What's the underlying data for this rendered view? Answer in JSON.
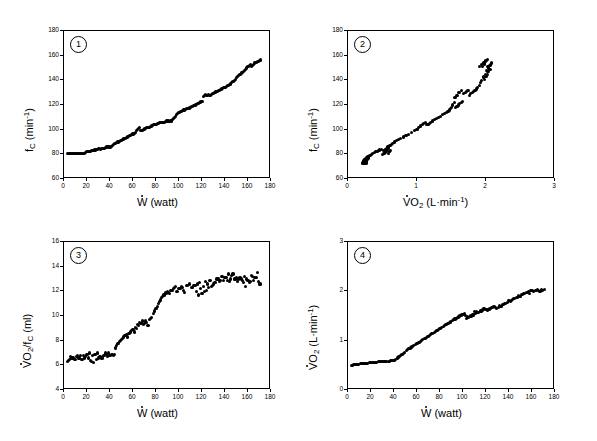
{
  "figure": {
    "background": "#ffffff",
    "marker_color": "#000000",
    "axis_color": "#000000",
    "layout": "2x2 grid of scatter panels"
  },
  "chart_data": [
    {
      "type": "scatter",
      "panel_number": "1",
      "title": "",
      "xlabel": "W (watt)",
      "xlabel_parts": {
        "symbol": "W",
        "dotted": true,
        "unit": "(watt)"
      },
      "ylabel": "fC (min-1)",
      "ylabel_parts": {
        "symbol": "f",
        "subscript": "C",
        "unit": "(min",
        "superscript": "-1",
        "unit_close": ")"
      },
      "xlim": [
        0,
        180
      ],
      "ylim": [
        60,
        180
      ],
      "xticks": [
        0,
        20,
        40,
        60,
        80,
        100,
        120,
        140,
        160,
        180
      ],
      "yticks": [
        60,
        80,
        100,
        120,
        140,
        160,
        180
      ],
      "grid": false,
      "legend": "none",
      "x": [
        3,
        4,
        5,
        6,
        7,
        8,
        9,
        10,
        11,
        12,
        13,
        14,
        15,
        16,
        17,
        18,
        19,
        20,
        21,
        22,
        23,
        24,
        25,
        26,
        27,
        28,
        29,
        30,
        31,
        32,
        33,
        34,
        35,
        36,
        37,
        38,
        39,
        40,
        41,
        42,
        43,
        44,
        45,
        46,
        47,
        48,
        49,
        50,
        51,
        52,
        53,
        54,
        55,
        56,
        57,
        58,
        59,
        60,
        61,
        62,
        63,
        64,
        65,
        66,
        67,
        68,
        69,
        70,
        71,
        72,
        73,
        74,
        75,
        76,
        77,
        78,
        79,
        80,
        81,
        82,
        83,
        84,
        85,
        86,
        87,
        88,
        89,
        90,
        91,
        92,
        93,
        94,
        95,
        96,
        97,
        98,
        99,
        100,
        101,
        102,
        103,
        104,
        105,
        106,
        107,
        108,
        109,
        110,
        111,
        112,
        113,
        114,
        115,
        116,
        117,
        118,
        119,
        120,
        121,
        122,
        123,
        124,
        125,
        126,
        127,
        128,
        129,
        130,
        131,
        132,
        133,
        134,
        135,
        136,
        137,
        138,
        139,
        140,
        141,
        142,
        143,
        144,
        145,
        146,
        147,
        148,
        149,
        150,
        151,
        152,
        153,
        154,
        155,
        156,
        157,
        158,
        159,
        160,
        161,
        162,
        163,
        164,
        165,
        166,
        167,
        168,
        169,
        170,
        171
      ],
      "y": [
        81,
        81,
        81,
        81,
        81,
        81,
        81,
        80.5,
        80.5,
        80.5,
        80.5,
        81,
        81,
        81,
        81,
        81,
        81.5,
        82,
        82,
        82,
        82.5,
        83,
        83,
        83,
        83.5,
        84,
        84,
        84.5,
        84.5,
        84,
        85,
        85,
        85,
        85.5,
        86,
        86,
        86.5,
        86,
        86.5,
        87,
        88,
        88.5,
        89,
        89.5,
        90,
        90.5,
        91,
        91.5,
        92,
        92.5,
        93,
        93.5,
        94,
        94.5,
        95,
        95.5,
        96,
        96.5,
        97,
        98,
        99,
        100,
        101,
        102,
        99,
        99.5,
        100,
        100.5,
        101,
        101.5,
        102,
        102,
        102.5,
        103,
        103.5,
        104,
        104,
        104.5,
        105,
        105,
        105.5,
        106,
        106,
        106,
        106,
        106.5,
        107,
        107,
        107,
        106.5,
        107,
        108,
        109,
        110,
        111,
        112,
        113,
        114,
        114.5,
        115,
        115.5,
        116,
        116,
        116.5,
        117,
        117,
        117.5,
        118,
        118.5,
        119,
        119.5,
        120,
        120.5,
        121,
        121.5,
        122,
        122.5,
        123,
        127,
        128,
        128.5,
        128,
        128,
        128.5,
        128,
        128.5,
        129,
        129.5,
        130,
        130.5,
        131,
        131.5,
        132,
        132.5,
        133,
        133.5,
        134,
        134.5,
        135,
        135.5,
        136,
        136.5,
        137,
        138,
        139,
        140,
        141,
        142,
        143,
        144,
        145,
        146,
        146.5,
        147,
        148,
        149,
        150,
        151,
        152,
        153,
        151,
        152,
        153,
        154,
        154.5,
        155,
        155.5,
        156,
        156.5,
        157,
        157.5,
        158
      ]
    },
    {
      "type": "scatter",
      "panel_number": "2",
      "title": "",
      "xlabel": "VO2 (L-min-1)",
      "xlabel_parts": {
        "symbol": "VO",
        "subscript": "2",
        "dotted": true,
        "unit": "(L·min",
        "superscript": "-1",
        "unit_close": ")"
      },
      "ylabel": "fC (min-1)",
      "ylabel_parts": {
        "symbol": "f",
        "subscript": "C",
        "unit": "(min",
        "superscript": "-1",
        "unit_close": ")"
      },
      "xlim": [
        0,
        3
      ],
      "ylim": [
        60,
        180
      ],
      "xticks": [
        0,
        1,
        2,
        3
      ],
      "yticks": [
        60,
        80,
        100,
        120,
        140,
        160,
        180
      ],
      "grid": false,
      "legend": "none",
      "x": [
        0.21,
        0.22,
        0.22,
        0.23,
        0.23,
        0.24,
        0.24,
        0.25,
        0.25,
        0.26,
        0.26,
        0.27,
        0.27,
        0.22,
        0.23,
        0.24,
        0.25,
        0.26,
        0.27,
        0.28,
        0.22,
        0.24,
        0.26,
        0.28,
        0.23,
        0.25,
        0.27,
        0.29,
        0.3,
        0.32,
        0.34,
        0.36,
        0.38,
        0.4,
        0.42,
        0.44,
        0.46,
        0.48,
        0.5,
        0.52,
        0.53,
        0.54,
        0.55,
        0.56,
        0.57,
        0.58,
        0.59,
        0.6,
        0.52,
        0.54,
        0.56,
        0.58,
        0.6,
        0.62,
        0.55,
        0.57,
        0.59,
        0.61,
        0.63,
        0.65,
        0.67,
        0.7,
        0.73,
        0.76,
        0.8,
        0.84,
        0.88,
        0.92,
        0.96,
        1.0,
        1.02,
        1.05,
        1.08,
        1.1,
        1.12,
        1.14,
        1.16,
        1.18,
        1.2,
        1.22,
        1.25,
        1.28,
        1.31,
        1.34,
        1.37,
        1.4,
        1.43,
        1.45,
        1.47,
        1.49,
        1.5,
        1.52,
        1.54,
        1.56,
        1.58,
        1.6,
        1.62,
        1.64,
        1.66,
        1.55,
        1.58,
        1.61,
        1.64,
        1.67,
        1.7,
        1.72,
        1.74,
        1.76,
        1.78,
        1.8,
        1.82,
        1.84,
        1.86,
        1.88,
        1.9,
        1.92,
        1.94,
        1.96,
        1.98,
        2.0,
        2.02,
        2.04,
        2.06,
        1.9,
        1.93,
        1.96,
        1.99,
        2.02,
        2.05,
        1.95,
        1.98,
        2.01,
        2.04,
        2.07,
        1.97,
        2.0,
        2.03,
        2.06,
        1.99,
        2.02,
        2.05,
        2.08
      ],
      "y": [
        73,
        73.5,
        74,
        74.5,
        75,
        75.5,
        76,
        76.5,
        74,
        73,
        73.5,
        74,
        75,
        72.5,
        73,
        74,
        75,
        76,
        77,
        78,
        73,
        74,
        75,
        76,
        73.5,
        74.5,
        75.5,
        77,
        78,
        79,
        80,
        81,
        81.5,
        82,
        82.5,
        83,
        83.5,
        84,
        80,
        80.5,
        81,
        81.5,
        82,
        83,
        84,
        85,
        81,
        82,
        83,
        84,
        85,
        86,
        82,
        83,
        84,
        85,
        86,
        87,
        88,
        89,
        90,
        91,
        92,
        93,
        94,
        95,
        96,
        98,
        99,
        100,
        102,
        103,
        104,
        105,
        106,
        104,
        104.5,
        105,
        106,
        107,
        108,
        109,
        110,
        111,
        112,
        113,
        114,
        115,
        116,
        117,
        118,
        120,
        122,
        118,
        119,
        120,
        121,
        122,
        123,
        126,
        128,
        130,
        132,
        129,
        130,
        131,
        132,
        128,
        129,
        130,
        131,
        132,
        133,
        134,
        136,
        138,
        140,
        142,
        141,
        143,
        145,
        147,
        149,
        151,
        153,
        143,
        145,
        147,
        149,
        151,
        153,
        148,
        150,
        152,
        154,
        156,
        151,
        153,
        155,
        157,
        152,
        154,
        156,
        158
      ]
    },
    {
      "type": "scatter",
      "panel_number": "3",
      "title": "",
      "xlabel": "W (watt)",
      "xlabel_parts": {
        "symbol": "W",
        "dotted": true,
        "unit": "(watt)"
      },
      "ylabel": "VO2/fC (ml)",
      "ylabel_parts": {
        "symbol": "VO",
        "subscript": "2",
        "dotted": true,
        "divider": "/f",
        "subscript2": "C",
        "unit": "(ml)"
      },
      "xlim": [
        0,
        180
      ],
      "ylim": [
        4,
        16
      ],
      "xticks": [
        0,
        20,
        40,
        60,
        80,
        100,
        120,
        140,
        160,
        180
      ],
      "yticks": [
        4,
        6,
        8,
        10,
        12,
        14,
        16
      ],
      "grid": false,
      "legend": "none",
      "x": [
        3,
        5,
        7,
        9,
        11,
        13,
        15,
        17,
        19,
        21,
        23,
        25,
        27,
        29,
        31,
        33,
        35,
        37,
        39,
        41,
        43,
        4,
        8,
        12,
        16,
        20,
        24,
        28,
        32,
        36,
        40,
        44,
        6,
        10,
        14,
        18,
        22,
        26,
        30,
        34,
        38,
        42,
        45,
        47,
        49,
        51,
        53,
        55,
        57,
        59,
        61,
        63,
        65,
        67,
        69,
        71,
        73,
        75,
        46,
        50,
        54,
        58,
        62,
        66,
        70,
        74,
        48,
        52,
        56,
        60,
        64,
        68,
        72,
        76,
        78,
        80,
        82,
        84,
        86,
        88,
        90,
        92,
        94,
        96,
        98,
        100,
        102,
        104,
        79,
        83,
        87,
        91,
        95,
        99,
        103,
        107,
        81,
        85,
        89,
        93,
        97,
        101,
        105,
        109,
        111,
        113,
        115,
        117,
        119,
        121,
        123,
        125,
        127,
        129,
        131,
        133,
        135,
        137,
        139,
        141,
        143,
        145,
        112,
        116,
        120,
        124,
        128,
        132,
        136,
        140,
        144,
        148,
        114,
        118,
        122,
        126,
        130,
        134,
        138,
        142,
        146,
        150,
        147,
        149,
        151,
        153,
        155,
        157,
        159,
        161,
        163,
        165,
        167,
        169,
        171,
        152,
        156,
        160,
        164,
        168,
        154,
        158,
        162,
        166,
        170
      ],
      "y": [
        6.3,
        6.5,
        6.6,
        6.5,
        6.7,
        6.6,
        6.5,
        6.8,
        6.7,
        6.6,
        6.4,
        6.8,
        6.9,
        7.0,
        6.7,
        6.6,
        6.8,
        6.9,
        7.0,
        6.9,
        6.8,
        6.4,
        6.6,
        6.8,
        6.5,
        6.9,
        6.3,
        6.5,
        6.7,
        7.0,
        6.8,
        6.9,
        6.7,
        6.5,
        6.8,
        6.6,
        7.0,
        6.2,
        6.6,
        6.8,
        6.7,
        6.9,
        7.4,
        7.8,
        8.0,
        8.2,
        8.4,
        8.3,
        8.6,
        8.8,
        8.7,
        9.0,
        9.2,
        9.4,
        9.3,
        9.6,
        9.2,
        9.8,
        7.6,
        8.1,
        8.5,
        8.7,
        9.1,
        9.5,
        9.4,
        9.7,
        7.9,
        8.3,
        8.6,
        8.9,
        9.3,
        9.6,
        9.5,
        9.9,
        10.2,
        10.6,
        11.0,
        11.3,
        11.6,
        11.9,
        12.0,
        11.8,
        12.1,
        12.3,
        12.0,
        12.2,
        12.4,
        12.1,
        10.4,
        11.2,
        11.7,
        11.9,
        12.2,
        12.0,
        12.3,
        12.5,
        10.8,
        11.5,
        11.8,
        12.1,
        12.4,
        12.2,
        11.9,
        12.6,
        12.3,
        12.5,
        12.0,
        11.7,
        12.2,
        12.4,
        12.8,
        12.6,
        12.9,
        12.5,
        12.7,
        13.0,
        12.8,
        13.2,
        12.9,
        13.1,
        13.4,
        13.0,
        12.3,
        12.6,
        11.8,
        12.1,
        12.4,
        12.7,
        12.9,
        13.1,
        12.8,
        13.0,
        12.5,
        12.7,
        12.0,
        12.3,
        12.6,
        13.0,
        13.2,
        12.9,
        13.3,
        13.1,
        13.4,
        13.0,
        12.8,
        13.1,
        12.9,
        13.2,
        13.0,
        12.7,
        13.3,
        12.9,
        13.1,
        12.8,
        12.6,
        13.0,
        12.7,
        12.9,
        13.2,
        13.5,
        13.0,
        12.4,
        12.8,
        13.1,
        12.6,
        12.2
      ]
    },
    {
      "type": "scatter",
      "panel_number": "4",
      "title": "",
      "xlabel": "W (watt)",
      "xlabel_parts": {
        "symbol": "W",
        "dotted": true,
        "unit": "(watt)"
      },
      "ylabel": "VO2 (L-min-1)",
      "ylabel_parts": {
        "symbol": "VO",
        "subscript": "2",
        "dotted": true,
        "unit": "(L·min",
        "superscript": "-1",
        "unit_close": ")"
      },
      "xlim": [
        0,
        180
      ],
      "ylim": [
        0,
        3
      ],
      "xticks": [
        0,
        20,
        40,
        60,
        80,
        100,
        120,
        140,
        160,
        180
      ],
      "yticks": [
        0,
        1,
        2,
        3
      ],
      "grid": false,
      "legend": "none",
      "x": [
        3,
        5,
        7,
        9,
        11,
        13,
        15,
        17,
        19,
        21,
        23,
        25,
        27,
        29,
        31,
        33,
        35,
        37,
        39,
        41,
        43,
        45,
        47,
        49,
        51,
        53,
        55,
        57,
        59,
        61,
        63,
        65,
        67,
        69,
        71,
        73,
        75,
        77,
        79,
        81,
        83,
        85,
        87,
        89,
        91,
        93,
        95,
        97,
        99,
        101,
        103,
        105,
        107,
        109,
        111,
        113,
        115,
        117,
        119,
        121,
        123,
        125,
        127,
        129,
        131,
        133,
        135,
        137,
        139,
        141,
        143,
        145,
        147,
        149,
        151,
        153,
        155,
        157,
        159,
        161,
        163,
        165,
        167,
        169,
        171,
        4,
        8,
        12,
        16,
        20,
        24,
        28,
        32,
        36,
        40,
        44,
        48,
        52,
        56,
        60,
        64,
        68,
        72,
        76,
        80,
        84,
        88,
        92,
        96,
        100,
        104,
        108,
        112,
        116,
        120,
        124,
        128,
        132,
        136,
        140,
        144,
        148,
        152,
        156,
        160,
        164,
        168,
        6,
        14,
        22,
        30,
        38,
        46,
        54,
        62,
        70,
        78,
        86,
        94,
        102,
        110,
        118,
        126,
        134,
        142,
        150,
        158,
        166
      ],
      "y": [
        0.5,
        0.51,
        0.52,
        0.52,
        0.53,
        0.53,
        0.54,
        0.54,
        0.55,
        0.55,
        0.56,
        0.56,
        0.57,
        0.57,
        0.57,
        0.58,
        0.58,
        0.59,
        0.6,
        0.62,
        0.65,
        0.68,
        0.72,
        0.76,
        0.8,
        0.84,
        0.87,
        0.9,
        0.93,
        0.96,
        0.99,
        1.02,
        1.05,
        1.08,
        1.11,
        1.14,
        1.17,
        1.2,
        1.23,
        1.26,
        1.29,
        1.32,
        1.35,
        1.38,
        1.41,
        1.44,
        1.47,
        1.5,
        1.52,
        1.54,
        1.45,
        1.47,
        1.5,
        1.52,
        1.55,
        1.57,
        1.6,
        1.62,
        1.65,
        1.62,
        1.64,
        1.67,
        1.69,
        1.66,
        1.68,
        1.7,
        1.73,
        1.75,
        1.78,
        1.8,
        1.83,
        1.85,
        1.88,
        1.9,
        1.93,
        1.95,
        1.98,
        2.0,
        2.02,
        1.99,
        2.01,
        2.03,
        2.0,
        2.02,
        2.03,
        0.5,
        0.52,
        0.53,
        0.54,
        0.55,
        0.56,
        0.57,
        0.57,
        0.58,
        0.59,
        0.67,
        0.74,
        0.82,
        0.88,
        0.95,
        1.0,
        1.06,
        1.13,
        1.19,
        1.25,
        1.31,
        1.36,
        1.43,
        1.48,
        1.53,
        1.48,
        1.53,
        1.58,
        1.6,
        1.63,
        1.65,
        1.67,
        1.71,
        1.76,
        1.81,
        1.86,
        1.91,
        1.94,
        1.97,
        2.01,
        2.02,
        2.03,
        0.51,
        0.54,
        0.55,
        0.57,
        0.59,
        0.7,
        0.85,
        0.97,
        1.09,
        1.21,
        1.33,
        1.45,
        1.51,
        1.59,
        1.64,
        1.68,
        1.74,
        1.82,
        1.89,
        1.96,
        2.02
      ]
    }
  ]
}
